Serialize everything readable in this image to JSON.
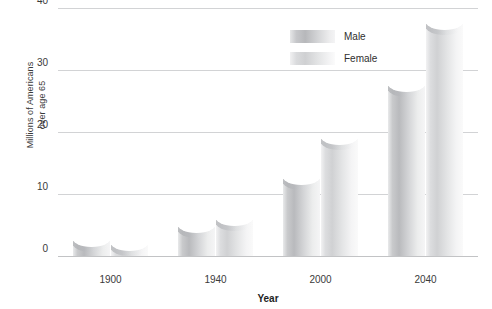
{
  "chart_data": {
    "type": "bar",
    "title": "",
    "xlabel": "Year",
    "ylabel": "Millions of Americans over age 65",
    "ylabel_line1": "Millions of Americans",
    "ylabel_line2": "over age 65",
    "categories": [
      "1900",
      "1940",
      "2000",
      "2040"
    ],
    "series": [
      {
        "name": "Male",
        "values": [
          3.1,
          5.4,
          13.0,
          28.0
        ]
      },
      {
        "name": "Female",
        "values": [
          2.5,
          6.4,
          19.5,
          38.0
        ]
      }
    ],
    "yticks": [
      0,
      10,
      20,
      30,
      40
    ],
    "ytick_labels": [
      "0",
      "10",
      "20",
      "30",
      "40"
    ],
    "ylim": [
      0,
      40
    ],
    "grid": true,
    "legend_position": "top-center",
    "colors": {
      "male": "#b9babd",
      "female": "#d0d1d3",
      "gridline": "#d2d3d5",
      "text": "#3a3a3a",
      "background": "#ffffff"
    }
  }
}
